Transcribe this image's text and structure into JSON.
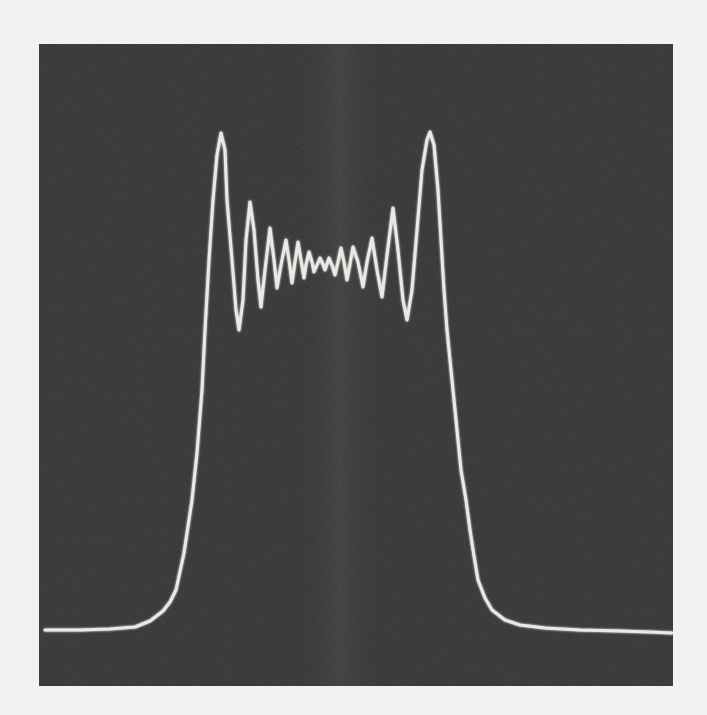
{
  "figure": {
    "colors": {
      "paper": "#f1f1ef",
      "screen": "#333333",
      "trace": "#e9e9e6",
      "graticule": "#3d3d3d",
      "center_band": "#3a3a3a"
    }
  },
  "chart_data": {
    "type": "line",
    "title": "",
    "xlabel": "",
    "ylabel": "",
    "grid": false,
    "legend": null,
    "units": "pixel coordinates within screenshot (no axis ticks shown)",
    "xlim": [
      39,
      673
    ],
    "ylim": [
      686,
      44
    ],
    "series": [
      {
        "name": "oscilloscope-trace",
        "points": [
          [
            45,
            630
          ],
          [
            80,
            630
          ],
          [
            110,
            629
          ],
          [
            135,
            627
          ],
          [
            150,
            621
          ],
          [
            163,
            611
          ],
          [
            170,
            602
          ],
          [
            176,
            590
          ],
          [
            184,
            553
          ],
          [
            192,
            500
          ],
          [
            197,
            453
          ],
          [
            202,
            390
          ],
          [
            205,
            330
          ],
          [
            209,
            260
          ],
          [
            213,
            200
          ],
          [
            217,
            155
          ],
          [
            221,
            133
          ],
          [
            225,
            150
          ],
          [
            227,
            200
          ],
          [
            232,
            260
          ],
          [
            236,
            310
          ],
          [
            239,
            330
          ],
          [
            243,
            300
          ],
          [
            246,
            240
          ],
          [
            250,
            202
          ],
          [
            254,
            230
          ],
          [
            258,
            280
          ],
          [
            261,
            307
          ],
          [
            265,
            270
          ],
          [
            270,
            228
          ],
          [
            274,
            260
          ],
          [
            277,
            288
          ],
          [
            281,
            265
          ],
          [
            286,
            240
          ],
          [
            289,
            260
          ],
          [
            292,
            283
          ],
          [
            295,
            262
          ],
          [
            298,
            242
          ],
          [
            301,
            260
          ],
          [
            304,
            278
          ],
          [
            306,
            265
          ],
          [
            309,
            252
          ],
          [
            312,
            262
          ],
          [
            314,
            272
          ],
          [
            317,
            265
          ],
          [
            320,
            258
          ],
          [
            322,
            262
          ],
          [
            325,
            270
          ],
          [
            327,
            264
          ],
          [
            329,
            258
          ],
          [
            332,
            265
          ],
          [
            335,
            275
          ],
          [
            338,
            262
          ],
          [
            341,
            248
          ],
          [
            344,
            262
          ],
          [
            347,
            280
          ],
          [
            350,
            264
          ],
          [
            353,
            247
          ],
          [
            358,
            262
          ],
          [
            363,
            287
          ],
          [
            367,
            262
          ],
          [
            372,
            238
          ],
          [
            377,
            270
          ],
          [
            382,
            297
          ],
          [
            387,
            255
          ],
          [
            393,
            208
          ],
          [
            398,
            250
          ],
          [
            403,
            300
          ],
          [
            407,
            320
          ],
          [
            412,
            290
          ],
          [
            417,
            230
          ],
          [
            422,
            170
          ],
          [
            427,
            140
          ],
          [
            430,
            132
          ],
          [
            434,
            145
          ],
          [
            438,
            190
          ],
          [
            441,
            240
          ],
          [
            444,
            290
          ],
          [
            447,
            330
          ],
          [
            451,
            370
          ],
          [
            454,
            400
          ],
          [
            458,
            440
          ],
          [
            461,
            470
          ],
          [
            466,
            500
          ],
          [
            470,
            530
          ],
          [
            474,
            556
          ],
          [
            478,
            580
          ],
          [
            485,
            598
          ],
          [
            492,
            610
          ],
          [
            505,
            620
          ],
          [
            520,
            625
          ],
          [
            545,
            628
          ],
          [
            580,
            630
          ],
          [
            620,
            631
          ],
          [
            650,
            632
          ],
          [
            672,
            633
          ]
        ]
      }
    ],
    "features": {
      "baseline_y": 630,
      "left_main_peak": [
        221,
        133
      ],
      "right_main_peak": [
        430,
        132
      ],
      "left_first_trough": [
        239,
        330
      ],
      "right_first_trough": [
        407,
        320
      ],
      "left_secondary_peak": [
        250,
        202
      ],
      "right_secondary_peak": [
        393,
        208
      ],
      "center_ripple_level": 265,
      "faint_graticule_line_y": 330
    }
  }
}
